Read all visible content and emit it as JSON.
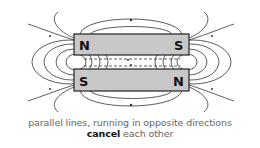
{
  "diagram": {
    "magnets": [
      {
        "left_pole": "N",
        "right_pole": "S"
      },
      {
        "left_pole": "S",
        "right_pole": "N"
      }
    ],
    "colors": {
      "magnet_fill": "#c8c8c8",
      "magnet_stroke": "#222222",
      "field_line": "#333333"
    }
  },
  "caption": {
    "line1": "parallel lines, running in opposite directions",
    "line2_bold": "cancel",
    "line2_rest": " each other"
  }
}
